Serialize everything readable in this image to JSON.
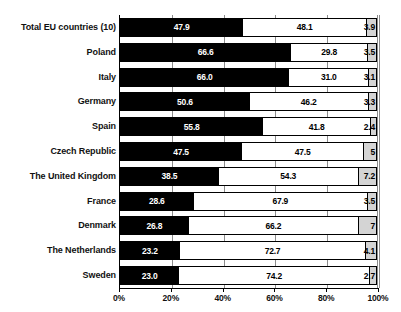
{
  "chart_data": {
    "type": "bar",
    "subtype": "stacked-horizontal-100pct",
    "title": "",
    "title_note": "title row is cut off at the top edge of the screenshot and unreadable",
    "xlabel": "",
    "ylabel": "",
    "xlim": [
      0,
      100
    ],
    "xticks": [
      "0%",
      "20%",
      "40%",
      "60%",
      "80%",
      "100%"
    ],
    "xtick_values": [
      0,
      20,
      40,
      60,
      80,
      100
    ],
    "grid": true,
    "legend": "none",
    "categories": [
      "Total EU countries (10)",
      "Poland",
      "Italy",
      "Germany",
      "Spain",
      "Czech Republic",
      "The United Kingdom",
      "France",
      "Denmark",
      "The Netherlands",
      "Sweden"
    ],
    "series": [
      {
        "name": "segment-1",
        "color": "#000000",
        "values": [
          47.9,
          66.6,
          66.0,
          50.6,
          55.8,
          47.5,
          38.5,
          28.6,
          26.8,
          23.2,
          23.0
        ],
        "labels": [
          "47.9",
          "66.6",
          "66.0",
          "50.6",
          "55.8",
          "47.5",
          "38.5",
          "28.6",
          "26.8",
          "23.2",
          "23.0"
        ]
      },
      {
        "name": "segment-2",
        "color": "#ffffff",
        "values": [
          48.1,
          29.8,
          31.0,
          46.2,
          41.8,
          47.5,
          54.3,
          67.9,
          66.2,
          72.7,
          74.2
        ],
        "labels": [
          "48.1",
          "29.8",
          "31.0",
          "46.2",
          "41.8",
          "47.5",
          "54.3",
          "67.9",
          "66.2",
          "72.7",
          "74.2"
        ]
      },
      {
        "name": "segment-3",
        "color": "#d4d4d4",
        "values": [
          3.9,
          3.5,
          3.1,
          3.3,
          2.4,
          5.0,
          7.2,
          3.5,
          7.0,
          4.1,
          2.7
        ],
        "labels": [
          "3.9",
          "3.5",
          "3.1",
          "3.3",
          "2.4",
          "5",
          "7.2",
          "3.5",
          "7",
          "4.1",
          "2.7"
        ]
      }
    ]
  }
}
